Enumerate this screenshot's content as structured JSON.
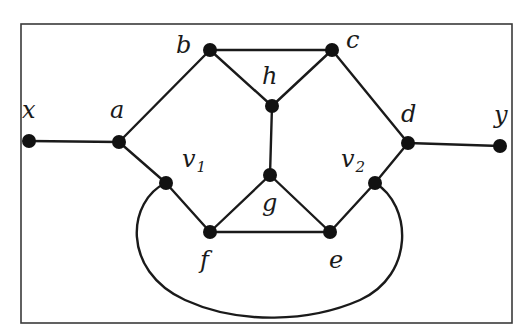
{
  "diagram": {
    "type": "graph",
    "frame": {
      "x": 21,
      "y": 24,
      "width": 491,
      "height": 299
    },
    "vertices": [
      {
        "id": "x",
        "label": "x",
        "sub": "",
        "cx": 29,
        "cy": 141,
        "lx": 22,
        "ly": 118
      },
      {
        "id": "a",
        "label": "a",
        "sub": "",
        "cx": 119,
        "cy": 142,
        "lx": 110,
        "ly": 118
      },
      {
        "id": "b",
        "label": "b",
        "sub": "",
        "cx": 210,
        "cy": 50,
        "lx": 176,
        "ly": 53
      },
      {
        "id": "c",
        "label": "c",
        "sub": "",
        "cx": 332,
        "cy": 50,
        "lx": 346,
        "ly": 48
      },
      {
        "id": "h",
        "label": "h",
        "sub": "",
        "cx": 272,
        "cy": 106,
        "lx": 262,
        "ly": 84
      },
      {
        "id": "d",
        "label": "d",
        "sub": "",
        "cx": 408,
        "cy": 143,
        "lx": 401,
        "ly": 122
      },
      {
        "id": "y",
        "label": "y",
        "sub": "",
        "cx": 500,
        "cy": 146,
        "lx": 494,
        "ly": 123
      },
      {
        "id": "v1",
        "label": "v",
        "sub": "1",
        "cx": 166,
        "cy": 183,
        "lx": 182,
        "ly": 167
      },
      {
        "id": "v2",
        "label": "v",
        "sub": "2",
        "cx": 375,
        "cy": 183,
        "lx": 341,
        "ly": 167
      },
      {
        "id": "g",
        "label": "g",
        "sub": "",
        "cx": 270,
        "cy": 175,
        "lx": 262,
        "ly": 211
      },
      {
        "id": "f",
        "label": "f",
        "sub": "",
        "cx": 210,
        "cy": 232,
        "lx": 200,
        "ly": 268
      },
      {
        "id": "e",
        "label": "e",
        "sub": "",
        "cx": 330,
        "cy": 232,
        "lx": 329,
        "ly": 268
      }
    ],
    "edges": [
      {
        "from": "x",
        "to": "a"
      },
      {
        "from": "a",
        "to": "b"
      },
      {
        "from": "a",
        "to": "v1"
      },
      {
        "from": "b",
        "to": "c"
      },
      {
        "from": "b",
        "to": "h"
      },
      {
        "from": "c",
        "to": "h"
      },
      {
        "from": "c",
        "to": "d"
      },
      {
        "from": "d",
        "to": "y"
      },
      {
        "from": "d",
        "to": "v2"
      },
      {
        "from": "h",
        "to": "g"
      },
      {
        "from": "g",
        "to": "f"
      },
      {
        "from": "g",
        "to": "e"
      },
      {
        "from": "v1",
        "to": "f"
      },
      {
        "from": "f",
        "to": "e"
      },
      {
        "from": "e",
        "to": "v2"
      }
    ],
    "curved_edges": [
      {
        "from": "v1",
        "to": "v2",
        "path": "M166,183 C128,200 120,270 185,300 C240,325 310,322 360,300 C415,275 412,205 375,183"
      }
    ]
  }
}
